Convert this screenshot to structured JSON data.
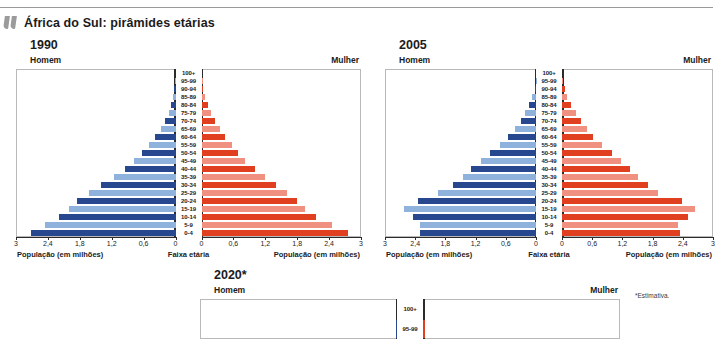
{
  "header": {
    "title": "África do Sul: pirâmides etárias",
    "icon": "quote-mark-icon"
  },
  "footnote": "*Estimativa.",
  "labels": {
    "male": "Homem",
    "female": "Mulher",
    "axis_population": "População (em milhões)",
    "axis_agegroup": "Faixa etária"
  },
  "colors": {
    "male_dark": "#27478f",
    "male_light": "#8fb2dd",
    "female_dark": "#e0401f",
    "female_light": "#ef9080",
    "axis": "#2b2b2b",
    "frame": "#b9b9b9",
    "icon_gray": "#9b9b9b"
  },
  "axis_ticks": [
    "3",
    "2,4",
    "1,8",
    "1,2",
    "0,6",
    "0"
  ],
  "age_groups": [
    "100+",
    "95-99",
    "90-94",
    "85-89",
    "80-84",
    "75-79",
    "70-74",
    "65-69",
    "60-64",
    "55-59",
    "50-54",
    "45-49",
    "40-44",
    "35-39",
    "30-34",
    "25-29",
    "20-24",
    "15-19",
    "10-14",
    "5-9",
    "0-4"
  ],
  "chart_data": [
    {
      "type": "bar",
      "title": "1990",
      "subtype": "population-pyramid",
      "xlabel": "População (em milhões)",
      "ylabel": "Faixa etária",
      "xlim": [
        0,
        3
      ],
      "grid": false,
      "categories": [
        "100+",
        "95-99",
        "90-94",
        "85-89",
        "80-84",
        "75-79",
        "70-74",
        "65-69",
        "60-64",
        "55-59",
        "50-54",
        "45-49",
        "40-44",
        "35-39",
        "30-34",
        "25-29",
        "20-24",
        "15-19",
        "10-14",
        "5-9",
        "0-4"
      ],
      "series": [
        {
          "name": "Homem",
          "side": "left",
          "values": [
            0.0,
            0.01,
            0.02,
            0.05,
            0.09,
            0.13,
            0.2,
            0.28,
            0.38,
            0.5,
            0.63,
            0.78,
            0.95,
            1.15,
            1.4,
            1.62,
            1.85,
            2.0,
            2.2,
            2.45,
            2.72
          ]
        },
        {
          "name": "Mulher",
          "side": "right",
          "values": [
            0.0,
            0.01,
            0.03,
            0.07,
            0.12,
            0.18,
            0.26,
            0.35,
            0.45,
            0.57,
            0.68,
            0.82,
            1.0,
            1.2,
            1.4,
            1.6,
            1.8,
            1.95,
            2.15,
            2.45,
            2.75
          ]
        }
      ]
    },
    {
      "type": "bar",
      "title": "2005",
      "subtype": "population-pyramid",
      "xlabel": "População (em milhões)",
      "ylabel": "Faixa etária",
      "xlim": [
        0,
        3
      ],
      "grid": false,
      "categories": [
        "100+",
        "95-99",
        "90-94",
        "85-89",
        "80-84",
        "75-79",
        "70-74",
        "65-69",
        "60-64",
        "55-59",
        "50-54",
        "45-49",
        "40-44",
        "35-39",
        "30-34",
        "25-29",
        "20-24",
        "15-19",
        "10-14",
        "5-9",
        "0-4"
      ],
      "series": [
        {
          "name": "Homem",
          "side": "left",
          "values": [
            0.0,
            0.01,
            0.03,
            0.07,
            0.13,
            0.21,
            0.3,
            0.42,
            0.55,
            0.72,
            0.92,
            1.1,
            1.3,
            1.45,
            1.65,
            1.95,
            2.35,
            2.62,
            2.45,
            2.3,
            2.3
          ]
        },
        {
          "name": "Mulher",
          "side": "right",
          "values": [
            0.0,
            0.02,
            0.05,
            0.1,
            0.18,
            0.27,
            0.38,
            0.5,
            0.62,
            0.8,
            1.0,
            1.18,
            1.35,
            1.5,
            1.7,
            1.9,
            2.38,
            2.65,
            2.5,
            2.3,
            2.35
          ]
        }
      ]
    },
    {
      "type": "bar",
      "title": "2020*",
      "subtype": "population-pyramid",
      "xlabel": "População (em milhões)",
      "ylabel": "Faixa etária",
      "xlim": [
        0,
        3
      ],
      "grid": false,
      "truncated_in_view": true,
      "categories": [
        "100+",
        "95-99"
      ],
      "series": [
        {
          "name": "Homem",
          "side": "left",
          "values": [
            0.0,
            0.02
          ]
        },
        {
          "name": "Mulher",
          "side": "right",
          "values": [
            0.0,
            0.03
          ]
        }
      ]
    }
  ]
}
